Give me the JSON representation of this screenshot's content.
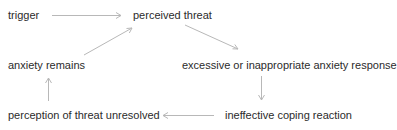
{
  "diagram": {
    "type": "cycle-flowchart",
    "nodes": [
      {
        "id": "trigger",
        "label": "trigger"
      },
      {
        "id": "perceived_threat",
        "label": "perceived threat"
      },
      {
        "id": "excessive_response",
        "label": "excessive or inappropriate anxiety response"
      },
      {
        "id": "ineffective_coping",
        "label": "ineffective coping reaction"
      },
      {
        "id": "threat_unresolved",
        "label": "perception of threat unresolved"
      },
      {
        "id": "anxiety_remains",
        "label": "anxiety remains"
      }
    ],
    "edges": [
      {
        "from": "trigger",
        "to": "perceived_threat"
      },
      {
        "from": "perceived_threat",
        "to": "excessive_response"
      },
      {
        "from": "excessive_response",
        "to": "ineffective_coping"
      },
      {
        "from": "ineffective_coping",
        "to": "threat_unresolved"
      },
      {
        "from": "threat_unresolved",
        "to": "anxiety_remains"
      },
      {
        "from": "anxiety_remains",
        "to": "perceived_threat"
      }
    ],
    "colors": {
      "text": "#2b2b2b",
      "arrow": "#b8b8b8",
      "background": "#ffffff"
    }
  }
}
